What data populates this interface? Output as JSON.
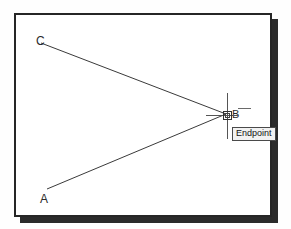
{
  "app": {
    "title": "CAD Drawing Area"
  },
  "drawing": {
    "frame": {
      "border_color": "#262626",
      "background_color": "#ffffff",
      "shadow_color": "#2b2b2b"
    },
    "vertices": [
      {
        "id": "C",
        "label": "C",
        "x": 41,
        "y": 43
      },
      {
        "id": "A",
        "label": "A",
        "x": 47,
        "y": 189
      },
      {
        "id": "B",
        "label": "B",
        "x": 226,
        "y": 114
      }
    ],
    "lines": [
      {
        "id": "line-cb",
        "from": "C",
        "to": "B",
        "color": "#3a3a3a"
      },
      {
        "id": "line-ab",
        "from": "A",
        "to": "B",
        "color": "#3a3a3a"
      }
    ],
    "line_color": "#3a3a3a"
  },
  "cursor": {
    "type": "crosshair",
    "x": 226,
    "y": 114,
    "color": "#555555",
    "snap_marker": {
      "type": "square",
      "osnap_mode": "Endpoint",
      "color": "#333333"
    }
  },
  "tooltip": {
    "text": "Endpoint",
    "background_color": "#f2f2f2",
    "border_color": "#4a4a4a",
    "text_color": "#111111"
  }
}
